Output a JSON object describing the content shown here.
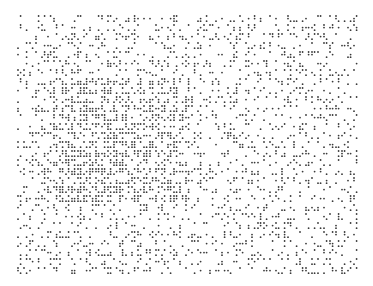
{
  "image": {
    "width": 373,
    "height": 286,
    "background": "#ffffff",
    "dot_color": "#3a3a3a",
    "dot_radius": 0.9
  },
  "pattern": {
    "type": "braille-dot-field",
    "area": {
      "x0": 18,
      "y0": 16,
      "x1": 358,
      "y1": 272
    },
    "cell_w": 6,
    "cell_h": 9,
    "dot_dx": 2.6,
    "dot_dy": 2.6,
    "base_density": 0.22,
    "dense_region": {
      "x0": 52,
      "y0": 76,
      "x1": 186,
      "y1": 200,
      "density": 0.5
    },
    "seed": 1337
  }
}
